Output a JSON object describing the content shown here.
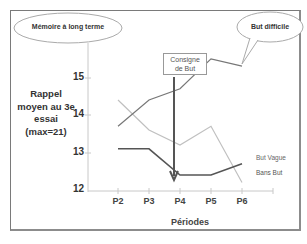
{
  "chart_data": {
    "type": "line",
    "title": "",
    "xlabel": "Périodes",
    "ylabel": "Rappel moyen au 3e essai (max=21)",
    "categories": [
      "P2",
      "P3",
      "P4",
      "P5",
      "P6"
    ],
    "ylim": [
      12,
      15.8
    ],
    "yticks": [
      12,
      13,
      14,
      15
    ],
    "grid": false,
    "series": [
      {
        "name": "But difficile",
        "color": "#6e6e6e",
        "values": [
          13.7,
          14.4,
          14.7,
          15.5,
          15.3
        ]
      },
      {
        "name": "But Vague",
        "color": "#b8b8b8",
        "values": [
          14.4,
          13.6,
          13.2,
          13.7,
          12.2
        ]
      },
      {
        "name": "Bans But",
        "color": "#555555",
        "values": [
          13.1,
          13.1,
          12.4,
          12.4,
          12.7
        ]
      }
    ],
    "annotations": [
      {
        "text": "Mémoire à long terme",
        "type": "ellipse-callout"
      },
      {
        "text": "But difficile",
        "type": "speech-bubble"
      },
      {
        "text": "Consigne de But",
        "type": "arrow-box",
        "at": "P4"
      }
    ]
  },
  "labels": {
    "ylabel_lines": [
      "Rappel",
      "moyen au 3e",
      "essai",
      "(max=21)"
    ],
    "yticks": [
      "15",
      "14",
      "13",
      "12"
    ],
    "xticks": [
      "P2",
      "P3",
      "P4",
      "P5",
      "P6"
    ],
    "xlabel": "Périodes",
    "callout_left": "Mémoire à long terme",
    "callout_right": "But difficile",
    "consigne_line1": "Consigne",
    "consigne_line2": "de But",
    "legend_vague": "But Vague",
    "legend_sans": "Bans But"
  }
}
